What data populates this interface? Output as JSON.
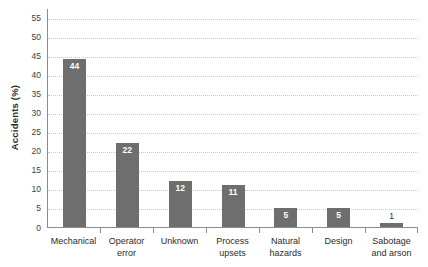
{
  "chart_data": {
    "type": "bar",
    "title": "",
    "subtitle": "",
    "xlabel": "",
    "ylabel": "Accidents (%)",
    "categories": [
      "Mechanical",
      "Operator error",
      "Unknown",
      "Process upsets",
      "Natural hazards",
      "Design",
      "Sabotage and arson"
    ],
    "category_lines": [
      [
        "Mechanical"
      ],
      [
        "Operator",
        "error"
      ],
      [
        "Unknown"
      ],
      [
        "Process",
        "upsets"
      ],
      [
        "Natural",
        "hazards"
      ],
      [
        "Design"
      ],
      [
        "Sabotage",
        "and arson"
      ]
    ],
    "values": [
      44,
      22,
      12,
      11,
      5,
      5,
      1
    ],
    "value_labels": [
      "44",
      "22",
      "12",
      "11",
      "5",
      "5",
      "1"
    ],
    "ylim": [
      0,
      57.5
    ],
    "yticks": [
      0,
      5,
      10,
      15,
      20,
      25,
      30,
      35,
      40,
      45,
      50,
      55
    ],
    "ytick_labels": [
      "0",
      "5",
      "10",
      "15",
      "20",
      "25",
      "30",
      "35",
      "40",
      "45",
      "50",
      "55"
    ],
    "grid": "horizontal-dotted",
    "legend": "none",
    "bar_color": "#6e6e6e",
    "value_label_color_inside": "#ffffff",
    "value_label_color_outside": "#2b2b2b",
    "grid_color": "#c9c9c9",
    "axis_color": "#8c8c8c",
    "text_color": "#2b2b2b",
    "background": "#ffffff"
  }
}
